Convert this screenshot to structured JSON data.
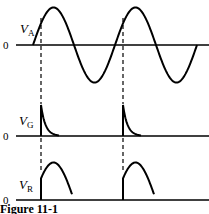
{
  "figure": {
    "caption": "Figure 11-1",
    "panels": [
      {
        "name": "anode-voltage",
        "label": "V",
        "subscript": "A",
        "zero_label": "0",
        "waveform": "sine (2 cycles)"
      },
      {
        "name": "gate-voltage",
        "label": "V",
        "subscript": "G",
        "zero_label": "0",
        "waveform": "decaying trigger spikes"
      },
      {
        "name": "load-voltage",
        "label": "V",
        "subscript": "R",
        "zero_label": "0",
        "waveform": "truncated positive half-cycles"
      }
    ],
    "trigger_marker": "dashed vertical lines at gate trigger points"
  }
}
